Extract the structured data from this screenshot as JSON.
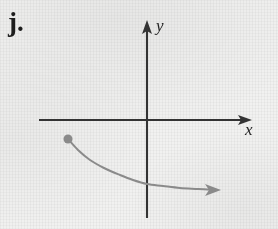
{
  "figure": {
    "item_label": "j.",
    "background_color": "#f1f1f0",
    "axis_color": "#333333",
    "curve_color": "#8a8a8a"
  },
  "axes": {
    "x_axis": {
      "label": "x",
      "orientation": "horizontal",
      "line_y": 120,
      "start_x": 39,
      "arrow_tip_x": 252,
      "has_arrowhead": true
    },
    "y_axis": {
      "label": "y",
      "orientation": "vertical",
      "line_x": 147,
      "arrow_tip_y": 20,
      "end_y": 218,
      "has_arrowhead": true
    },
    "origin": {
      "x": 147,
      "y": 120
    }
  },
  "chart_data": {
    "type": "line",
    "title": "",
    "subtitle": "",
    "xlabel": "x",
    "ylabel": "y",
    "grid": false,
    "legend": null,
    "axis_style": "arrowed-cartesian-axes",
    "annotations": [
      {
        "kind": "endpoint-dot",
        "style": "filled",
        "x_px": 68,
        "y_px": 139,
        "radius_px": 4.5,
        "color": "#8a8a8a"
      },
      {
        "kind": "arrowhead",
        "x_px": 218,
        "y_px": 190,
        "direction": "right",
        "color": "#8a8a8a"
      }
    ],
    "series": [
      {
        "name": "curve",
        "color": "#8a8a8a",
        "stroke_width": 2,
        "start_marker": "filled-dot",
        "end_marker": "arrow",
        "points_px": [
          [
            68,
            139
          ],
          [
            78,
            150
          ],
          [
            90,
            160
          ],
          [
            104,
            168
          ],
          [
            120,
            175
          ],
          [
            133,
            180
          ],
          [
            147,
            184
          ],
          [
            163,
            186
          ],
          [
            180,
            188
          ],
          [
            198,
            189
          ],
          [
            215,
            190
          ]
        ],
        "description": "Decreasing concave-up curve beginning in the third quadrant at a filled point, falling steeply then flattening toward a horizontal asymptote, crossing below the origin and continuing right into the fourth quadrant ending in an arrow."
      }
    ]
  }
}
